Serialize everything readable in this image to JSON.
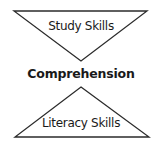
{
  "diagram": {
    "top_triangle": {
      "orientation": "inverted",
      "label": "Study Skills"
    },
    "center_label": "Comprehension",
    "bottom_triangle": {
      "orientation": "upright",
      "label": "Literacy Skills"
    },
    "stroke_color": "#2b2b2b",
    "text_color": "#1a1a1a"
  }
}
